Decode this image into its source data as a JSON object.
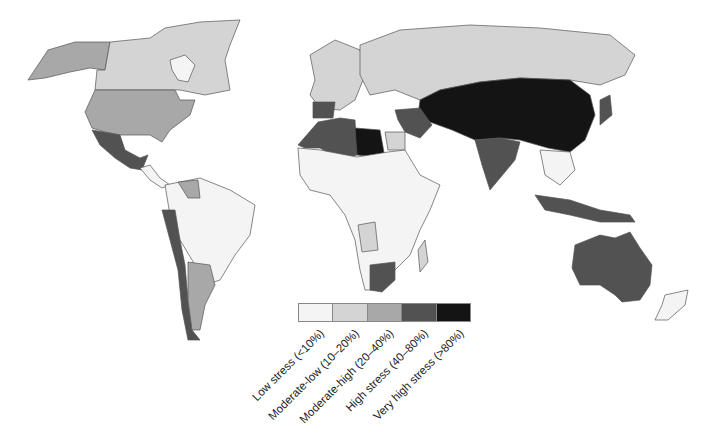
{
  "map": {
    "type": "choropleth",
    "subject": "Water stress by country",
    "background": "#ffffff",
    "border_color": "#555555"
  },
  "legend": {
    "items": [
      {
        "label": "Low stress (<10%)",
        "color": "#f4f4f4"
      },
      {
        "label": "Moderate-low (10–20%)",
        "color": "#d4d4d4"
      },
      {
        "label": "Moderate-high (20–40%)",
        "color": "#a8a8a8"
      },
      {
        "label": "High stress (40–80%)",
        "color": "#525252"
      },
      {
        "label": "Very high stress (>80%)",
        "color": "#141414"
      }
    ]
  },
  "regions": {
    "alaska": "moderate-high",
    "canada": "moderate-low",
    "greenland": "low",
    "usa": "moderate-high",
    "mexico": "high",
    "central_america": "low",
    "venezuela": "moderate-high",
    "peru_chile": "high",
    "brazil": "low",
    "argentina": "moderate-high",
    "iberia": "high",
    "north_africa_morocco_algeria": "high",
    "libya": "very-high",
    "egypt": "moderate-low",
    "sub_saharan_africa": "low",
    "south_africa": "high",
    "russia": "moderate-low",
    "middle_east_central_asia_china": "very-high",
    "india": "high",
    "southeast_asia": "low",
    "indonesia": "high",
    "australia": "high",
    "new_zealand": "low"
  }
}
